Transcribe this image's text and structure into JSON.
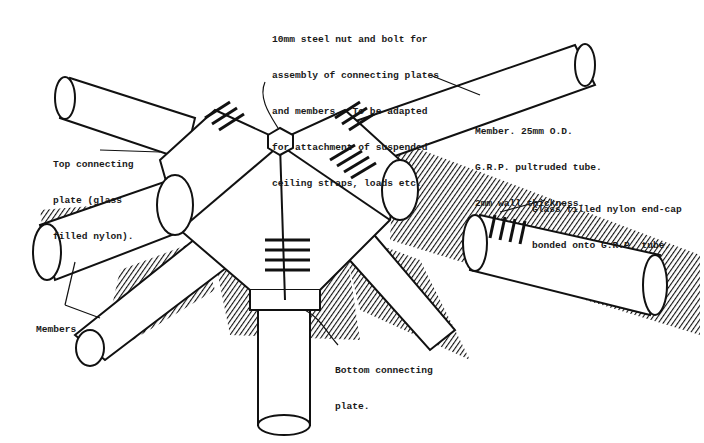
{
  "diagram": {
    "annotations": [
      {
        "id": "bolt",
        "lines": [
          "10mm steel nut and bolt for",
          "assembly of connecting plates",
          "and members.  To be adapted",
          "for attachment of suspended",
          "ceiling straps, loads etc."
        ]
      },
      {
        "id": "member",
        "lines": [
          "Member. 25mm O.D.",
          "G.R.P. pultruded tube.",
          "2mm wall thickness."
        ]
      },
      {
        "id": "top-plate",
        "lines": [
          "Top connecting",
          "plate (glass",
          "filled nylon)."
        ]
      },
      {
        "id": "end-cap",
        "lines": [
          "Glass filled nylon end-cap",
          "bonded onto G.R.P. tube."
        ]
      },
      {
        "id": "bottom-plate",
        "lines": [
          "Bottom connecting",
          "plate."
        ]
      },
      {
        "id": "members",
        "lines": [
          "Members"
        ]
      }
    ]
  }
}
